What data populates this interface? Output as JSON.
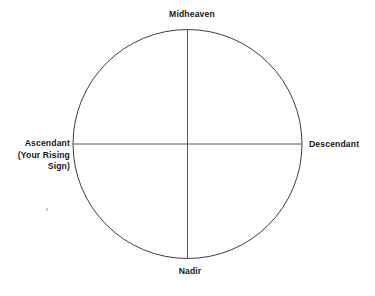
{
  "diagram": {
    "type": "astrology-chart-axes",
    "title_text": "",
    "shape": {
      "name": "circle",
      "center_x": 187.5,
      "center_y": 144,
      "radius": 114.5,
      "stroke_color": "#3d3d46",
      "stroke_width": 1,
      "fill": "none"
    },
    "axes": [
      {
        "name": "vertical-axis",
        "from": "Midheaven",
        "to": "Nadir",
        "x1": 187.5,
        "y1": 29.5,
        "x2": 187.5,
        "y2": 258.5,
        "stroke_color": "#55555f"
      },
      {
        "name": "horizontal-axis",
        "from": "Ascendant",
        "to": "Descendant",
        "x1": 73,
        "y1": 144,
        "x2": 302,
        "y2": 144,
        "stroke_color": "#55555f"
      }
    ],
    "labels": {
      "midheaven": "Midheaven",
      "nadir": "Nadir",
      "descendant": "Descendant",
      "ascendant_line1": "Ascendant",
      "ascendant_line2": "(Your Rising",
      "ascendant_line3": "Sign)"
    },
    "colors": {
      "text": "#16161d",
      "line": "#55555f",
      "circle": "#3d3d46",
      "background": "#ffffff"
    }
  }
}
